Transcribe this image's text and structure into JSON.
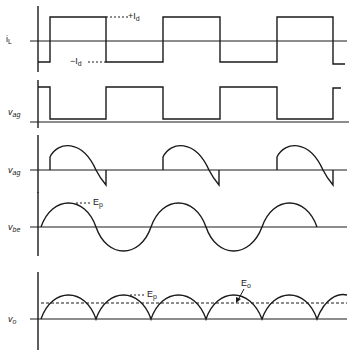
{
  "diagram": {
    "title": "",
    "colors": {
      "stroke": "#1a1a1a",
      "background": "#ffffff"
    },
    "panels": [
      {
        "id": "iL",
        "label_main": "i",
        "label_sub": "L",
        "type": "square-wave",
        "annotations": [
          {
            "main": "+I",
            "sub": "d"
          },
          {
            "main": "−I",
            "sub": "d"
          }
        ]
      },
      {
        "id": "vag-square",
        "label_main": "v",
        "label_sub": "ag",
        "type": "pulse-train"
      },
      {
        "id": "vag-segment",
        "label_main": "v",
        "label_sub": "ag",
        "type": "sinusoid-segments"
      },
      {
        "id": "vbe",
        "label_main": "v",
        "label_sub": "be",
        "type": "sinusoid",
        "annotations": [
          {
            "main": "E",
            "sub": "p"
          }
        ]
      },
      {
        "id": "vo",
        "label_main": "v",
        "label_sub": "o",
        "type": "full-wave-rectified",
        "annotations": [
          {
            "main": "E",
            "sub": "p"
          },
          {
            "main": "E",
            "sub": "o"
          }
        ]
      }
    ]
  }
}
